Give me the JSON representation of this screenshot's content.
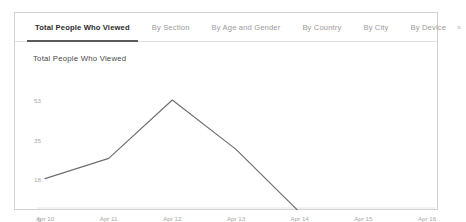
{
  "panel": {
    "tabs": [
      {
        "label": "Total People Who Viewed",
        "active": true
      },
      {
        "label": "By Section",
        "active": false
      },
      {
        "label": "By Age and Gender",
        "active": false
      },
      {
        "label": "By Country",
        "active": false
      },
      {
        "label": "By City",
        "active": false
      },
      {
        "label": "By Device",
        "active": false
      }
    ],
    "overflow_label": "»"
  },
  "colors": {
    "panel_border": "#d2d2d2",
    "tab_active_text": "#2b2b2b",
    "tab_active_underline": "#5a5a5a",
    "tab_inactive_text": "#9a9a9a",
    "line": "#6e6e6e",
    "axis": "#e6e6e6",
    "tick_text": "#a8a8a8"
  },
  "chart_data": {
    "type": "line",
    "title": "Total People Who Viewed",
    "xlabel": "",
    "ylabel": "",
    "x": [
      "Apr 10",
      "Apr 11",
      "Apr 12",
      "Apr 13",
      "Apr 14",
      "Apr 15",
      "Apr 16"
    ],
    "categories": [
      "Apr 10",
      "Apr 11",
      "Apr 12",
      "Apr 13",
      "Apr 14",
      "Apr 15",
      "Apr 16"
    ],
    "values": [
      18,
      27,
      53,
      31,
      3,
      2,
      2
    ],
    "series": [
      {
        "name": "Total People Who Viewed",
        "values": [
          18,
          27,
          53,
          31,
          3,
          2,
          2
        ]
      }
    ],
    "yticks": [
      53,
      35,
      18,
      0
    ],
    "ytick_labels": [
      "53",
      "35",
      "18",
      "0"
    ],
    "ylim": [
      0,
      53
    ],
    "xtick_labels": [
      "Apr 10",
      "Apr 11",
      "Apr 12",
      "Apr 13",
      "Apr 14",
      "Apr 15",
      "Apr 16"
    ],
    "grid": false,
    "legend": false,
    "line_color": "#6e6e6e"
  }
}
